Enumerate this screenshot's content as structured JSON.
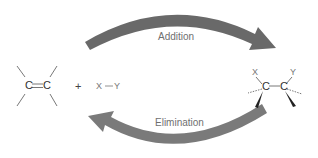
{
  "diagram": {
    "type": "reaction-scheme",
    "forward_arrow": {
      "label": "Addition",
      "color": "#6b6b6b",
      "direction": "left-to-right"
    },
    "reverse_arrow": {
      "label": "Elimination",
      "color": "#7a7a7a",
      "direction": "right-to-left"
    },
    "reactants": {
      "alkene": {
        "atom1": "C",
        "atom2": "C",
        "bond": "="
      },
      "plus": "+",
      "reagent": {
        "x": "X",
        "bond": "—",
        "y": "Y"
      }
    },
    "product": {
      "atom1": "C",
      "atom2": "C",
      "substituent1": "X",
      "substituent2": "Y"
    }
  }
}
